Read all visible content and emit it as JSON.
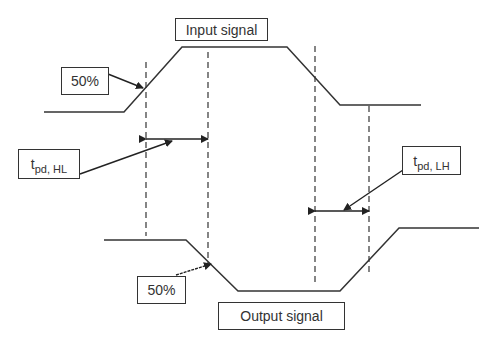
{
  "diagram": {
    "type": "timing-diagram",
    "labels": {
      "input_signal": "Input signal",
      "output_signal": "Output signal",
      "input_50": "50%",
      "output_50": "50%",
      "tpd_hl_main": "t",
      "tpd_hl_sub": "pd, HL",
      "tpd_lh_main": "t",
      "tpd_lh_sub": "pd, LH"
    },
    "colors": {
      "line": "#333333",
      "background": "#ffffff"
    }
  }
}
